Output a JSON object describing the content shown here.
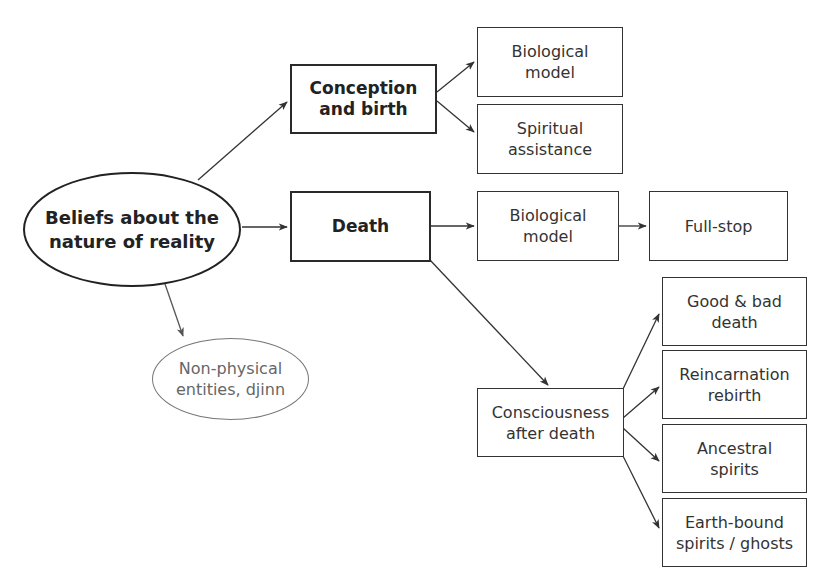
{
  "diagram": {
    "root": {
      "label": "Beliefs about the\nnature of reality"
    },
    "conception": {
      "label": "Conception\nand birth"
    },
    "conception_bio": {
      "label": "Biological\nmodel"
    },
    "conception_spirit": {
      "label": "Spiritual\nassistance"
    },
    "death": {
      "label": "Death"
    },
    "death_bio": {
      "label": "Biological\nmodel"
    },
    "fullstop": {
      "label": "Full-stop"
    },
    "nonphysical": {
      "label": "Non-physical\nentities, djinn"
    },
    "consciousness": {
      "label": "Consciousness\nafter death"
    },
    "outcomes": [
      {
        "label": "Good & bad\ndeath"
      },
      {
        "label": "Reincarnation\nrebirth"
      },
      {
        "label": "Ancestral\nspirits"
      },
      {
        "label": "Earth-bound\nspirits / ghosts"
      }
    ],
    "edges": [
      [
        "Beliefs about the nature of reality",
        "Conception and birth"
      ],
      [
        "Beliefs about the nature of reality",
        "Death"
      ],
      [
        "Beliefs about the nature of reality",
        "Non-physical entities, djinn"
      ],
      [
        "Conception and birth",
        "Biological model"
      ],
      [
        "Conception and birth",
        "Spiritual assistance"
      ],
      [
        "Death",
        "Biological model"
      ],
      [
        "Biological model",
        "Full-stop"
      ],
      [
        "Death",
        "Consciousness after death"
      ],
      [
        "Consciousness after death",
        "Good & bad death"
      ],
      [
        "Consciousness after death",
        "Reincarnation rebirth"
      ],
      [
        "Consciousness after death",
        "Ancestral spirits"
      ],
      [
        "Consciousness after death",
        "Earth-bound spirits / ghosts"
      ]
    ]
  }
}
